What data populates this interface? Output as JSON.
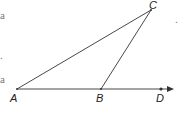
{
  "figure": {
    "points": {
      "A": {
        "label": "A",
        "x": 17,
        "y": 89
      },
      "B": {
        "label": "B",
        "x": 101,
        "y": 89
      },
      "C": {
        "label": "C",
        "x": 151,
        "y": 10
      },
      "D": {
        "label": "D",
        "x": 161,
        "y": 89
      }
    },
    "segments": [
      [
        "A",
        "C"
      ],
      [
        "B",
        "C"
      ],
      [
        "A",
        "B"
      ]
    ],
    "ray": {
      "from": "A",
      "through": "D",
      "arrow_tip_x": 174
    },
    "stroke_color": "#333333"
  },
  "margin_fragments": {
    "left": [
      "a",
      ".",
      "a"
    ],
    "right": [
      "."
    ]
  }
}
